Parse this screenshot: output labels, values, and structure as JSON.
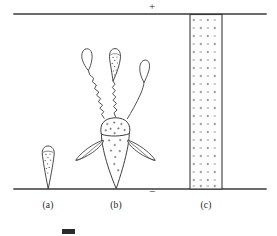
{
  "figure": {
    "width": 277,
    "height": 236,
    "background_color": "#ffffff",
    "ink_color": "#2b2b2b"
  },
  "electrodes": {
    "top": {
      "name": "anode",
      "polarity_symbol": "+",
      "y": 14,
      "x_start": 14,
      "x_end": 266
    },
    "bottom": {
      "name": "cathode",
      "polarity_symbol": "−",
      "y": 189,
      "x_start": 14,
      "x_end": 266
    }
  },
  "panels": [
    {
      "id": "a",
      "label": "(a)",
      "description": "single small avalanche head near cathode",
      "center_x": 48
    },
    {
      "id": "b",
      "label": "(b)",
      "description": "branched streamer with upward and lateral filaments",
      "center_x": 116
    },
    {
      "id": "c",
      "label": "(c)",
      "description": "fully bridged conducting channel column filled with plus and minus charges",
      "center_x": 206
    }
  ],
  "charge_column": {
    "name": "charge-column",
    "x_left": 190,
    "x_right": 222,
    "y_top": 14,
    "y_bottom": 189,
    "fill_color": "#fdfdfd",
    "border_color": "#3a3a3a",
    "rows": 21,
    "cols": 4,
    "symbol_pattern": [
      "+",
      "−",
      "+",
      "−"
    ],
    "symbol_color": "#4a4a4a"
  },
  "charges": {
    "positive_symbol": "+",
    "negative_symbol": "−",
    "dot_symbol": "·"
  },
  "caption": {
    "swatch_label": "",
    "text_fragment": "",
    "visible": true
  }
}
